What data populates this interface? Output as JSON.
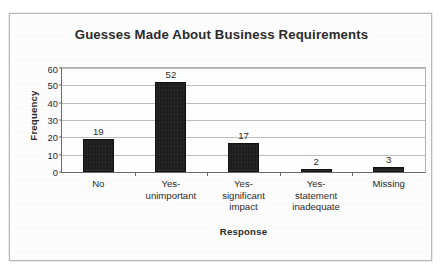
{
  "figure": {
    "title": "Guesses Made About Business Requirements",
    "x_axis_title": "Response",
    "y_axis_title": "Frequency"
  },
  "chart_data": {
    "type": "bar",
    "title": "Guesses Made About Business Requirements",
    "xlabel": "Response",
    "ylabel": "Frequency",
    "categories": [
      "No",
      "Yes-unimportant",
      "Yes-significant impact",
      "Yes-statement inadequate",
      "Missing"
    ],
    "category_lines": [
      [
        "No"
      ],
      [
        "Yes-",
        "unimportant"
      ],
      [
        "Yes-",
        "significant",
        "impact"
      ],
      [
        "Yes-",
        "statement",
        "inadequate"
      ],
      [
        "Missing"
      ]
    ],
    "values": [
      19,
      52,
      17,
      2,
      3
    ],
    "data_labels": [
      "19",
      "52",
      "17",
      "2",
      "3"
    ],
    "ylim": [
      0,
      60
    ],
    "yticks": [
      0,
      10,
      20,
      30,
      40,
      50,
      60
    ],
    "ytick_labels": [
      "0",
      "10",
      "20",
      "30",
      "40",
      "50",
      "60"
    ],
    "grid": "horizontal",
    "legend": "none",
    "bar_color": "#1c1c1c",
    "plot_background": "#ffffff",
    "gridline_color": "#bdbdbd",
    "axis_color": "#6b6b6b"
  }
}
